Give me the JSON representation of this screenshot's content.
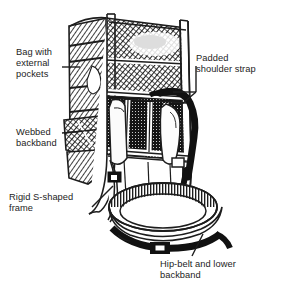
{
  "figure": {
    "kind": "line-illustration",
    "background_color": "#ffffff",
    "ink_color": "#1d1d1d"
  },
  "labels": [
    {
      "id": "bag",
      "name": "callout-bag-with-external-pockets",
      "lines": [
        "Bag with",
        "external",
        "pockets"
      ],
      "text": "Bag with\nexternal\npockets"
    },
    {
      "id": "webbed",
      "name": "callout-webbed-backband",
      "lines": [
        "Webbed",
        "backband"
      ],
      "text": "Webbed\nbackband"
    },
    {
      "id": "frame",
      "name": "callout-rigid-s-shaped-frame",
      "lines": [
        "Rigid S-shaped",
        "frame"
      ],
      "text": "Rigid S-shaped\nframe"
    },
    {
      "id": "shoulder",
      "name": "callout-padded-shoulder-strap",
      "lines": [
        "Padded",
        "shoulder strap"
      ],
      "text": "Padded\nshoulder strap"
    },
    {
      "id": "hipbelt",
      "name": "callout-hip-belt-and-lower-backband",
      "lines": [
        "Hip-belt and lower",
        "backband"
      ],
      "text": "Hip-belt and lower\nbackband"
    }
  ]
}
